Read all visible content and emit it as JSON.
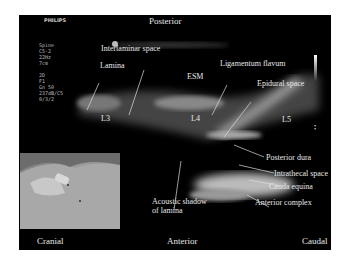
{
  "header": {
    "brand": "PHILIPS",
    "orientation_top": "Posterior"
  },
  "settings": [
    "Spine",
    "C5-2",
    "22Hz",
    "7cm",
    "",
    "2D",
    "F1",
    "Gn 50",
    "237dB/C5",
    "0/3/2"
  ],
  "labels": {
    "lamina": "Lamina",
    "interlaminar": "Interlaminar space",
    "esm": "ESM",
    "ligamentum": "Ligamentum flavum",
    "epidural": "Epidural space",
    "l3": "L3",
    "l4": "L4",
    "l5": "L5",
    "posterior_dura": "Posterior dura",
    "intrathecal": "Intrathecal space",
    "cauda": "Cauda equina",
    "anterior_complex": "Anterior complex",
    "acoustic_1": "Acoustic shadow",
    "acoustic_2": "of lamina"
  },
  "footer": {
    "left": "Cranial",
    "center": "Anterior",
    "right": "Caudal"
  },
  "colors": {
    "background": "#000000",
    "label": "#e8e8e8",
    "border": "#ffffff"
  }
}
